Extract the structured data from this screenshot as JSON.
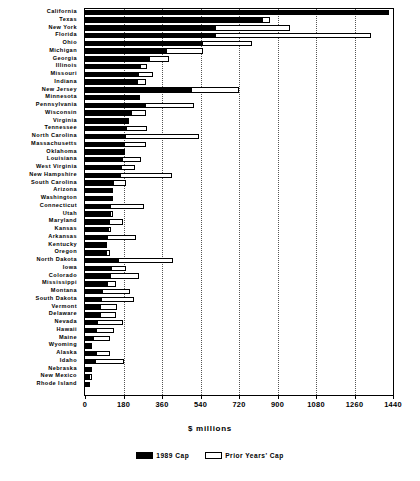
{
  "chart_data": {
    "type": "bar",
    "orientation": "horizontal-stacked",
    "title": "",
    "xlabel": "$ millions",
    "ylabel": "",
    "xlim": [
      0,
      1440
    ],
    "xticks": [
      0,
      180,
      360,
      540,
      720,
      900,
      1080,
      1260,
      1440
    ],
    "xtick_labels": [
      "0",
      "180",
      "360",
      "540",
      "720",
      "900",
      "1080",
      "1260",
      "1440"
    ],
    "grid": true,
    "grid_axis": "x",
    "legend_position": "bottom-center",
    "legend": [
      "1989 Cap",
      "Prior Years' Cap"
    ],
    "categories": [
      "California",
      "Texas",
      "New York",
      "Florida",
      "Ohio",
      "Michigan",
      "Georgia",
      "Illinois",
      "Missouri",
      "Indiana",
      "New Jersey",
      "Minnesota",
      "Pennsylvania",
      "Wisconsin",
      "Virginia",
      "Tennessee",
      "North Carolina",
      "Massachusetts",
      "Oklahoma",
      "Louisiana",
      "West Virginia",
      "New Hampshire",
      "South Carolina",
      "Arizona",
      "Washington",
      "Connecticut",
      "Utah",
      "Maryland",
      "Kansas",
      "Arkansas",
      "Kentucky",
      "Oregon",
      "North Dakota",
      "Iowa",
      "Colorado",
      "Mississippi",
      "Montana",
      "South Dakota",
      "Vermont",
      "Delaware",
      "Nevada",
      "Hawaii",
      "Maine",
      "Wyoming",
      "Alaska",
      "Idaho",
      "Nebraska",
      "New Mexico",
      "Rhode Island"
    ],
    "series": [
      {
        "name": "1989 Cap",
        "color": "#000000",
        "values": [
          1420,
          829,
          610,
          607,
          548,
          378,
          300,
          255,
          248,
          245,
          497,
          255,
          282,
          215,
          196,
          193,
          185,
          182,
          176,
          172,
          168,
          165,
          132,
          122,
          120,
          118,
          115,
          112,
          108,
          105,
          102,
          96,
          152,
          120,
          118,
          105,
          78,
          74,
          72,
          70,
          54,
          52,
          38,
          35,
          50,
          48,
          22,
          21,
          12
        ]
      },
      {
        "name": "Prior Years' Cap",
        "color": "#ffffff",
        "values": [
          0,
          36,
          347,
          728,
          232,
          172,
          93,
          37,
          70,
          42,
          223,
          0,
          227,
          68,
          10,
          95,
          348,
          102,
          10,
          88,
          68,
          244,
          58,
          7,
          12,
          160,
          18,
          65,
          12,
          134,
          0,
          23,
          258,
          72,
          135,
          40,
          133,
          153,
          77,
          73,
          125,
          85,
          79,
          0,
          65,
          136,
          6,
          14,
          12
        ]
      }
    ]
  },
  "axis": {
    "x_title": "$ millions"
  },
  "legend": {
    "items": [
      {
        "label": "1989 Cap",
        "swatch": "black"
      },
      {
        "label": "Prior Years' Cap",
        "swatch": "white"
      }
    ]
  }
}
